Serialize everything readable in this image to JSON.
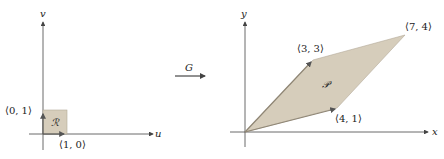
{
  "left_panel": {
    "horizontal_axis_label": "u",
    "vertical_axis_label": "v",
    "region_label": "ℛ",
    "points": [
      {
        "label": "⟨0, 1⟩"
      },
      {
        "label": "⟨1, 0⟩"
      }
    ]
  },
  "map": {
    "label": "G"
  },
  "right_panel": {
    "horizontal_axis_label": "x",
    "vertical_axis_label": "y",
    "region_label": "𝒫",
    "points": [
      {
        "label": "⟨3, 3⟩"
      },
      {
        "label": "⟨7, 4⟩"
      },
      {
        "label": "⟨4, 1⟩"
      }
    ]
  },
  "colors": {
    "region_fill": "#d6cdbb",
    "region_edge": "#9e9483",
    "axis": "#444444"
  }
}
